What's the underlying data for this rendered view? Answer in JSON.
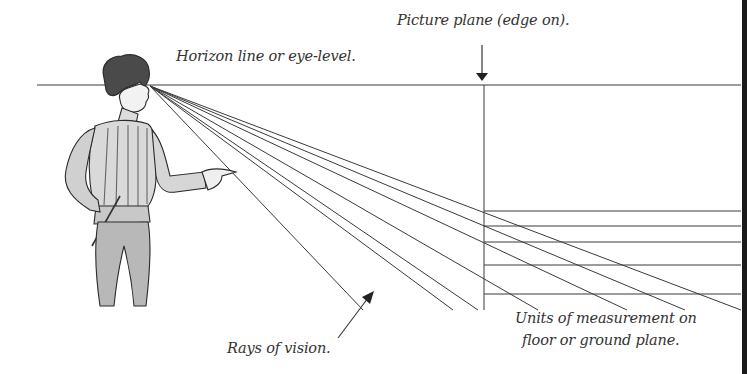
{
  "diagram": {
    "labels": {
      "horizon": "Horizon line or eye-level.",
      "picture_plane": "Picture plane (edge on).",
      "rays": "Rays of vision.",
      "units_line1": "Units of measurement on",
      "units_line2": "floor or ground plane."
    },
    "colors": {
      "line": "#3a3a3a",
      "text": "#333333",
      "figure_shade": "#8a8a8a",
      "background": "#ffffff",
      "border": "#1a1a1a"
    },
    "horizon_line": {
      "x1": 37,
      "x2": 741,
      "y": 85
    },
    "eye_point": {
      "x": 150,
      "y": 86
    },
    "picture_plane": {
      "x": 484,
      "y_top": 85,
      "y_bottom": 310,
      "arrow_top": 45,
      "arrow_tip": 80
    },
    "floor_lines_y": [
      211,
      226,
      242,
      265,
      294
    ],
    "floor_lines_x_range": [
      484,
      741
    ],
    "ray_endpoints": [
      {
        "x": 363,
        "y": 310
      },
      {
        "x": 453,
        "y": 310
      },
      {
        "x": 478,
        "y": 310
      },
      {
        "x": 538,
        "y": 310
      },
      {
        "x": 627,
        "y": 310
      },
      {
        "x": 685,
        "y": 310
      },
      {
        "x": 741,
        "y": 310
      }
    ],
    "rays_arrow": {
      "from": {
        "x": 338,
        "y": 338
      },
      "to": {
        "x": 372,
        "y": 293
      }
    },
    "figure": "Renaissance man in doublet pointing toward picture plane"
  }
}
